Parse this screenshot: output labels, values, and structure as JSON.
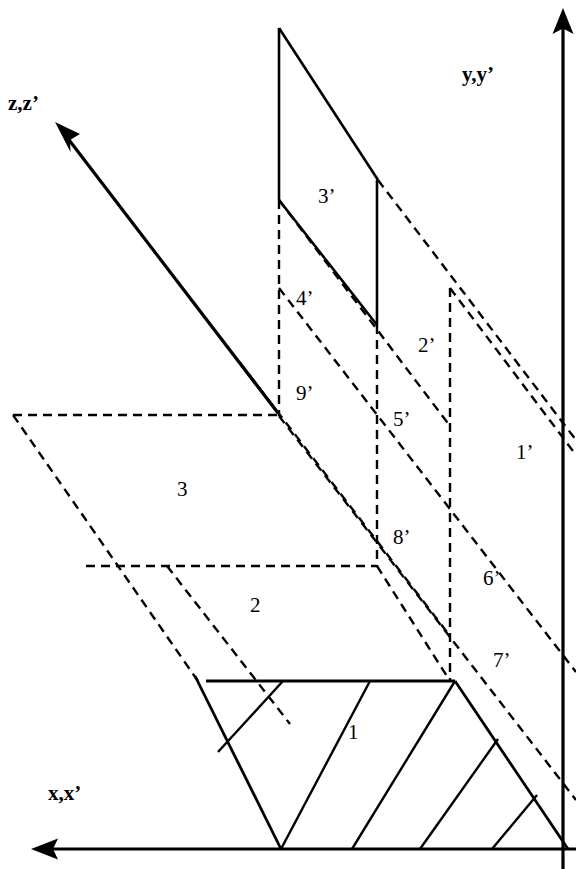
{
  "figure": {
    "kind": "technical-line-diagram",
    "background_color": "#ffffff",
    "stroke_color": "#000000"
  },
  "axes": [
    {
      "id": "axis-z",
      "label": "z,z’",
      "label_x": 8,
      "label_y": 93,
      "direction": "upper-left",
      "arrow": true
    },
    {
      "id": "axis-y",
      "label": "y,y’",
      "label_x": 462,
      "label_y": 64,
      "direction": "up",
      "arrow": true
    },
    {
      "id": "axis-x",
      "label": "x,x’",
      "label_x": 48,
      "label_y": 783,
      "direction": "left",
      "arrow": true
    }
  ],
  "regions": [
    {
      "id": "region-3-prime",
      "label": "3’",
      "x": 318,
      "y": 186
    },
    {
      "id": "region-4-prime",
      "label": "4’",
      "x": 296,
      "y": 288
    },
    {
      "id": "region-2-prime",
      "label": "2’",
      "x": 418,
      "y": 335
    },
    {
      "id": "region-9-prime",
      "label": "9’",
      "x": 296,
      "y": 383
    },
    {
      "id": "region-5-prime",
      "label": "5’",
      "x": 393,
      "y": 409
    },
    {
      "id": "region-1-prime",
      "label": "1’",
      "x": 516,
      "y": 442
    },
    {
      "id": "region-3",
      "label": "3",
      "x": 177,
      "y": 479
    },
    {
      "id": "region-8-prime",
      "label": "8’",
      "x": 393,
      "y": 527
    },
    {
      "id": "region-6-prime",
      "label": "6’",
      "x": 483,
      "y": 568
    },
    {
      "id": "region-2",
      "label": "2",
      "x": 250,
      "y": 595
    },
    {
      "id": "region-7-prime",
      "label": "7’",
      "x": 493,
      "y": 650
    },
    {
      "id": "region-1",
      "label": "1",
      "x": 348,
      "y": 722
    }
  ]
}
